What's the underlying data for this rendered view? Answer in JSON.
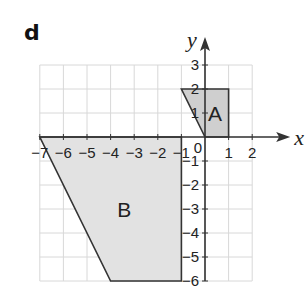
{
  "panel": {
    "label": "d"
  },
  "axes": {
    "x_name": "x",
    "y_name": "y",
    "x_range": [
      -7,
      2
    ],
    "y_range": [
      -6,
      3
    ],
    "origin_label": "0",
    "x_tick_labels": [
      "−7",
      "−6",
      "−5",
      "−4",
      "−3",
      "−2",
      "−1",
      "1",
      "2"
    ],
    "x_tick_values": [
      -7,
      -6,
      -5,
      -4,
      -3,
      -2,
      -1,
      1,
      2
    ],
    "y_tick_labels": [
      "3",
      "2",
      "1",
      "−1",
      "−2",
      "−3",
      "−4",
      "−5",
      "−6"
    ],
    "y_tick_values": [
      3,
      2,
      1,
      -1,
      -2,
      -3,
      -4,
      -5,
      -6
    ]
  },
  "shapes": [
    {
      "name": "A",
      "vertices": [
        [
          0,
          0
        ],
        [
          1,
          0
        ],
        [
          1,
          2
        ],
        [
          -1,
          2
        ]
      ],
      "fill": "#cfcfcf",
      "stroke": "#333333"
    },
    {
      "name": "B",
      "vertices": [
        [
          -7,
          0
        ],
        [
          -1,
          0
        ],
        [
          -1,
          -6
        ],
        [
          -4,
          -6
        ]
      ],
      "fill": "#e2e2e2",
      "stroke": "#333333"
    }
  ]
}
